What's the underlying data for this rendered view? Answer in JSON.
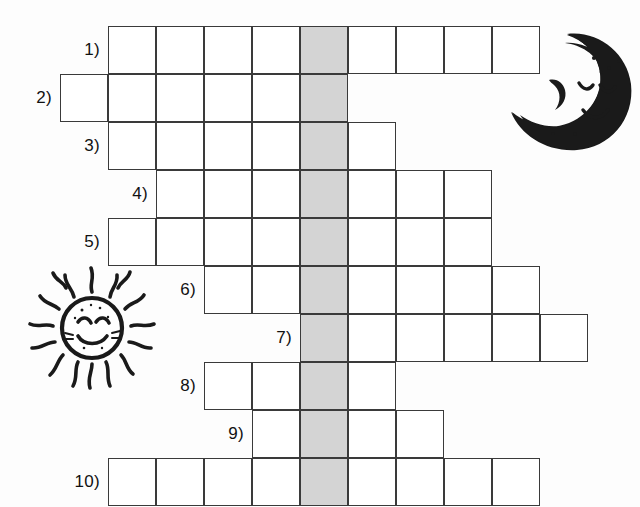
{
  "worksheet": {
    "title": "Crossword puzzle worksheet",
    "grid": {
      "cell_size": 48,
      "origin_x": 108,
      "origin_y": 26,
      "highlight_column_index": 4,
      "highlight_color": "#d4d4d4",
      "cell_border_color": "#3a3a3a",
      "cell_fill_color": "#ffffff",
      "rows": [
        {
          "number_label": "1)",
          "start_col": 0,
          "length": 9
        },
        {
          "number_label": "2)",
          "start_col": -1,
          "length": 6
        },
        {
          "number_label": "3)",
          "start_col": 0,
          "length": 6
        },
        {
          "number_label": "4)",
          "start_col": 1,
          "length": 7
        },
        {
          "number_label": "5)",
          "start_col": 0,
          "length": 8
        },
        {
          "number_label": "6)",
          "start_col": 2,
          "length": 7
        },
        {
          "number_label": "7)",
          "start_col": 4,
          "length": 6
        },
        {
          "number_label": "8)",
          "start_col": 2,
          "length": 4
        },
        {
          "number_label": "9)",
          "start_col": 3,
          "length": 4
        },
        {
          "number_label": "10)",
          "start_col": 0,
          "length": 9
        }
      ]
    },
    "illustrations": [
      {
        "name": "moon-illustration",
        "label": "smiling crescent moon",
        "x": 505,
        "y": 28,
        "width": 130,
        "height": 125
      },
      {
        "name": "sun-illustration",
        "label": "smiling sun with rays",
        "x": 18,
        "y": 262,
        "width": 148,
        "height": 132
      }
    ]
  }
}
